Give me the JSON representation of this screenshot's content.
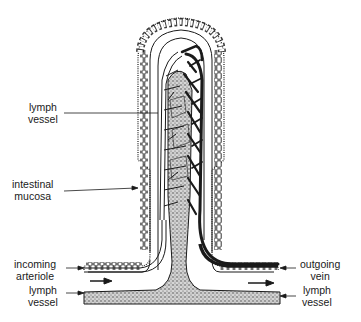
{
  "diagram": {
    "labels": {
      "lymph_vessel_top": {
        "line1": "lymph",
        "line2": "vessel"
      },
      "intestinal_mucosa": {
        "line1": "intestinal",
        "line2": "mucosa"
      },
      "incoming_arteriole": {
        "line1": "incoming",
        "line2": "arteriole"
      },
      "lymph_vessel_left": {
        "line1": "lymph",
        "line2": "vessel"
      },
      "outgoing_vein": {
        "line1": "outgoing",
        "line2": "vein"
      },
      "lymph_vessel_right": {
        "line1": "lymph",
        "line2": "vessel"
      }
    },
    "colors": {
      "ink": "#1a1a1a",
      "stipple": "#9a9a9a",
      "background": "#ffffff"
    }
  }
}
